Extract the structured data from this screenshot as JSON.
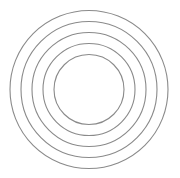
{
  "diagram": {
    "type": "concentric-circles",
    "center": {
      "x": 89,
      "y": 89.5
    },
    "stroke_color": "#8a8a8a",
    "stroke_width": 1.1,
    "background": "#ffffff",
    "circles": [
      {
        "r": 79
      },
      {
        "r": 68
      },
      {
        "r": 57
      },
      {
        "r": 46
      },
      {
        "r": 35
      }
    ]
  }
}
